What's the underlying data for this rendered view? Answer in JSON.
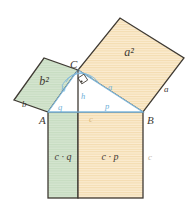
{
  "figure": {
    "type": "geometry-diagram"
  },
  "colors": {
    "green_fill": "#d5e5d0",
    "green_hatch": "#c3dabd",
    "orange_fill": "#fae8c8",
    "orange_hatch": "#f2d9ab",
    "outline_dark": "#3f3a33",
    "blue_line": "#7fb8dc",
    "blue_label": "#6fb0d8",
    "vertex_label": "#3f3a33",
    "area_label": "#3f3a33",
    "white_fill": "#ffffff",
    "background": "#ffffff"
  },
  "vertices": [
    {
      "name": "A",
      "label": "A",
      "x": 48,
      "y": 112
    },
    {
      "name": "B",
      "label": "B",
      "x": 143,
      "y": 112
    },
    {
      "name": "C",
      "label": "C",
      "x": 78,
      "y": 70
    }
  ],
  "vertex_label_positions": [
    {
      "label": "A",
      "x": 41,
      "y": 122
    },
    {
      "label": "B",
      "x": 147,
      "y": 122
    },
    {
      "label": "C",
      "x": 73,
      "y": 66
    }
  ],
  "squares": [
    {
      "name": "square-on-b",
      "area_label": "b²",
      "fill": "green",
      "label_x": 43,
      "label_y": 80,
      "points": "48,112 78,70 44,58 14,100"
    },
    {
      "name": "square-on-a",
      "area_label": "a²",
      "fill": "orange",
      "label_x": 128,
      "label_y": 52,
      "points": "78,70 143,112 184,58 120,18"
    }
  ],
  "rectangles": [
    {
      "name": "rect-c-times-q",
      "area_label": "c · q",
      "fill": "green",
      "label_x": 62,
      "label_y": 160,
      "x": 48,
      "y": 112,
      "width": 30,
      "height": 86
    },
    {
      "name": "rect-c-times-p",
      "area_label": "c · p",
      "fill": "orange",
      "label_x": 110,
      "label_y": 160,
      "x": 78,
      "y": 112,
      "width": 65,
      "height": 86
    }
  ],
  "triangle": {
    "name": "right-triangle-ABC",
    "points": "48,112 143,112 78,70",
    "fill": "white",
    "right_angle_at": "C"
  },
  "segment_labels": [
    {
      "name": "side-b-outer",
      "label": "b",
      "x": 24,
      "y": 105,
      "color": "dark",
      "size": 9
    },
    {
      "name": "side-b-inner",
      "label": "b",
      "x": 63,
      "y": 90,
      "color": "blue",
      "size": 8
    },
    {
      "name": "side-a-outer",
      "label": "a",
      "x": 166,
      "y": 90,
      "color": "dark",
      "size": 9
    },
    {
      "name": "side-a-inner",
      "label": "a",
      "x": 111,
      "y": 88,
      "color": "blue",
      "size": 8
    },
    {
      "name": "altitude-h",
      "label": "h",
      "x": 82,
      "y": 97,
      "color": "blue",
      "size": 8
    },
    {
      "name": "segment-q",
      "label": "q",
      "x": 60,
      "y": 109,
      "color": "blue",
      "size": 8
    },
    {
      "name": "segment-p",
      "label": "p",
      "x": 107,
      "y": 108,
      "color": "blue",
      "size": 8
    },
    {
      "name": "side-c-inner",
      "label": "c",
      "x": 91,
      "y": 120,
      "color": "orange-dim",
      "size": 8
    },
    {
      "name": "side-c-outer",
      "label": "c",
      "x": 150,
      "y": 158,
      "color": "dim",
      "size": 9
    }
  ],
  "markers": {
    "right_angle": {
      "name": "right-angle-marker-at-C",
      "x": 78,
      "y": 70,
      "size": 7
    },
    "angle_arcs": [
      {
        "name": "angle-arc-alpha",
        "d": "M 66,82 A 16,16 0 0 1 93,79"
      },
      {
        "name": "angle-arc-beta",
        "d": "M 62,86 A 21,21 0 0 1 98,82"
      }
    ]
  }
}
